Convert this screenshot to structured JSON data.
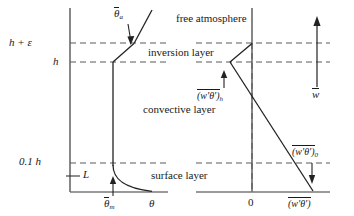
{
  "figure": {
    "type": "diagram",
    "panels": [
      {
        "name": "potential-temperature-profile",
        "x_axis_label": "θ",
        "x_tick_labels": [
          "θ",
          "θ"
        ],
        "mixed_layer_value_label": "θ",
        "mixed_layer_value_sub": "m",
        "aloft_label": "θ",
        "aloft_sub": "a",
        "obukhov_label": "L"
      },
      {
        "name": "heat-flux-profile",
        "x_axis_label": "(w'θ')",
        "zero_tick": "0",
        "flux_at_h_label": "(w'θ')",
        "flux_at_h_sub": "h",
        "surface_flux_label": "(w'θ')",
        "surface_flux_sub": "0",
        "entrainment_velocity_label": "w"
      }
    ],
    "height_levels": [
      {
        "id": "h-plus-eps",
        "label": "h + ε",
        "y": 43
      },
      {
        "id": "h",
        "label": "h",
        "y": 62
      },
      {
        "id": "point-one-h",
        "label": "0.1 h",
        "y": 163
      }
    ],
    "layers": [
      {
        "id": "free-atmosphere",
        "label": "free  atmosphere"
      },
      {
        "id": "inversion-layer",
        "label": "inversion  layer"
      },
      {
        "id": "convective-layer",
        "label": "convective  layer"
      },
      {
        "id": "surface-layer",
        "label": "surface  layer"
      }
    ],
    "colors": {
      "ink": "#1a1a1a",
      "axis": "#555555",
      "dashed": "#5a5a5a"
    }
  }
}
